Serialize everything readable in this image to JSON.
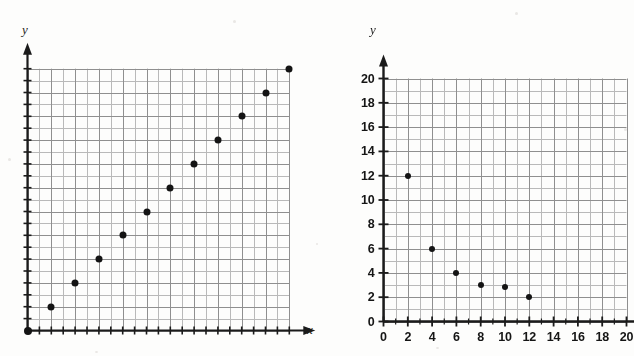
{
  "figure": {
    "background_color": "#fdfdfc",
    "grid_color": "#8f8f8f",
    "grid_minor_color": "#b9b9b9",
    "axis_color": "#1b1b1b",
    "point_color": "#141414"
  },
  "chart_data": [
    {
      "type": "scatter",
      "name": "left-plot",
      "title": "",
      "xlabel": "x",
      "ylabel": "y",
      "grid": true,
      "grid_minor_step": 1,
      "grid_major_step": 2,
      "xlim": [
        0,
        22
      ],
      "ylim": [
        0,
        22
      ],
      "xticklabels": [],
      "yticklabels": [],
      "x": [
        0,
        2,
        4,
        6,
        8,
        10,
        12,
        14,
        16,
        18,
        20,
        22
      ],
      "y": [
        0,
        3,
        5,
        7,
        9,
        11,
        13,
        15,
        17,
        19,
        21,
        23
      ],
      "points": [
        {
          "x": 0,
          "y": 0
        },
        {
          "x": 2,
          "y": 2
        },
        {
          "x": 4,
          "y": 4
        },
        {
          "x": 6,
          "y": 6
        },
        {
          "x": 8,
          "y": 8
        },
        {
          "x": 10,
          "y": 10
        },
        {
          "x": 12,
          "y": 12
        },
        {
          "x": 14,
          "y": 14
        },
        {
          "x": 16,
          "y": 16
        },
        {
          "x": 18,
          "y": 18
        },
        {
          "x": 20,
          "y": 20
        },
        {
          "x": 22,
          "y": 22
        }
      ]
    },
    {
      "type": "scatter",
      "name": "right-plot",
      "title": "",
      "xlabel": "",
      "ylabel": "y",
      "grid": true,
      "grid_minor_step": 1,
      "grid_major_step": 2,
      "xlim": [
        0,
        20
      ],
      "ylim": [
        0,
        20
      ],
      "xticks": [
        0,
        2,
        4,
        6,
        8,
        10,
        12,
        14,
        16,
        18,
        20
      ],
      "yticks": [
        0,
        2,
        4,
        6,
        8,
        10,
        12,
        14,
        16,
        18,
        20
      ],
      "xticklabels": [
        "0",
        "2",
        "4",
        "6",
        "8",
        "10",
        "12",
        "14",
        "16",
        "18",
        "20"
      ],
      "yticklabels": [
        "0",
        "2",
        "4",
        "6",
        "8",
        "10",
        "12",
        "14",
        "16",
        "18",
        "20"
      ],
      "points": [
        {
          "x": 2,
          "y": 12
        },
        {
          "x": 4,
          "y": 6
        },
        {
          "x": 6,
          "y": 4
        },
        {
          "x": 8,
          "y": 3
        },
        {
          "x": 10,
          "y": 2.8
        },
        {
          "x": 12,
          "y": 2
        }
      ]
    }
  ],
  "left_plot": {
    "y_axis_label": "y",
    "x_axis_label": "x"
  },
  "right_plot": {
    "y_axis_label": "y",
    "x_axis_label": ""
  }
}
